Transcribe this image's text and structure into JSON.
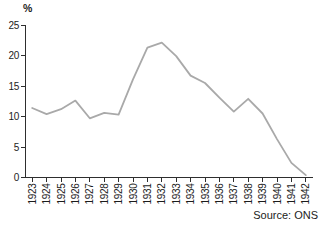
{
  "chart_data": {
    "type": "line",
    "categories": [
      "1923",
      "1924",
      "1925",
      "1926",
      "1927",
      "1928",
      "1929",
      "1930",
      "1931",
      "1932",
      "1933",
      "1934",
      "1935",
      "1936",
      "1937",
      "1938",
      "1939",
      "1940",
      "1941",
      "1942"
    ],
    "values": [
      11.4,
      10.4,
      11.2,
      12.6,
      9.7,
      10.6,
      10.3,
      16.1,
      21.3,
      22.1,
      19.9,
      16.7,
      15.5,
      13.1,
      10.8,
      12.9,
      10.5,
      6.3,
      2.4,
      0.4
    ],
    "ylabel": "%",
    "ylim": [
      0,
      25
    ],
    "yticks": [
      0,
      5,
      10,
      15,
      20,
      25
    ],
    "grid": false,
    "legend": false,
    "source": "Source: ONS"
  },
  "colors": {
    "line": "#a9a9a9",
    "axis": "#2e2e2e",
    "text": "#1c1c1c",
    "background": "#ffffff"
  }
}
